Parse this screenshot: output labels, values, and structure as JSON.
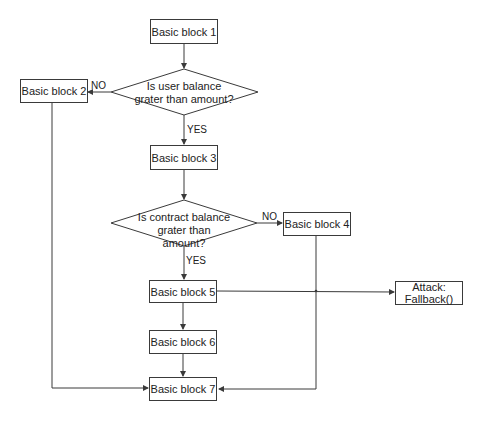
{
  "blocks": {
    "b1": "Basic block 1",
    "b2": "Basic block 2",
    "b3": "Basic block 3",
    "b4": "Basic block 4",
    "b5": "Basic block 5",
    "b6": "Basic block 6",
    "b7": "Basic block 7",
    "attack": "Attack: Fallback()"
  },
  "decisions": {
    "d1": "Is user balance grater than amount?",
    "d2": "Is contract balance grater than amount?"
  },
  "labels": {
    "d1_no": "NO",
    "d1_yes": "YES",
    "d2_no": "NO",
    "d2_yes": "YES"
  },
  "colors": {
    "stroke": "#3a3a3a",
    "text": "#222222",
    "background": "#ffffff"
  }
}
